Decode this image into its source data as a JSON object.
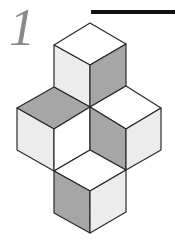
{
  "label": {
    "number": "1"
  },
  "colors": {
    "white": "#ffffff",
    "light": "#ececec",
    "dark": "#a6a6a6",
    "stroke": "#2a2a2a"
  },
  "figure": {
    "cubes": [
      {
        "name": "top-cube",
        "top": "white",
        "left": "light",
        "right": "dark"
      },
      {
        "name": "left-cube",
        "top": "dark",
        "left": "light",
        "right": "white"
      },
      {
        "name": "right-cube",
        "top": "white",
        "left": "dark",
        "right": "light"
      },
      {
        "name": "bottom-cube",
        "top": "white",
        "left": "dark",
        "right": "light"
      }
    ]
  }
}
